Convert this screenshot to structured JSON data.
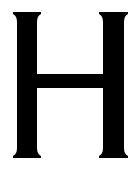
{
  "glyph": {
    "character": "H",
    "color": "#000000",
    "background": "#ffffff"
  }
}
